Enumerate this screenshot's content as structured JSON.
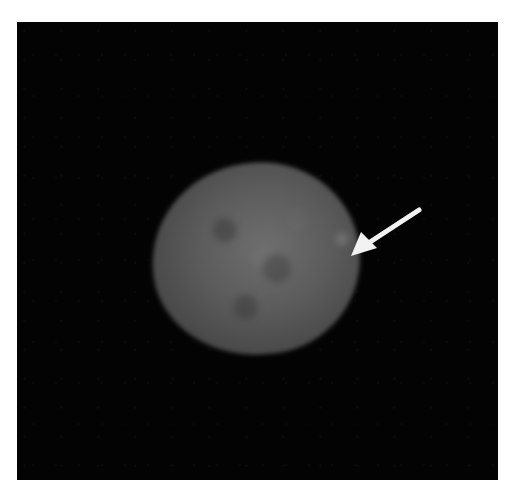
{
  "image": {
    "description": "Fluorescence micrograph of a cell nucleus on black background",
    "subject": "cell nucleus",
    "annotation": {
      "type": "arrow",
      "points_to": "bright spot on right edge of nucleus",
      "icon": "arrow-icon",
      "color": "#f2f2f2"
    },
    "background_color": "#030303",
    "nucleus_color": "#5c5c5c"
  }
}
